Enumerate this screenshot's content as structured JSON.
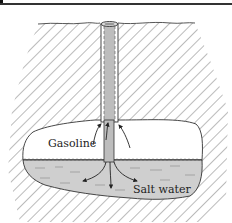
{
  "diagram": {
    "labels": {
      "gasoline": "Gasoline",
      "salt_water": "Salt water"
    },
    "colors": {
      "hatch": "#555555",
      "cavity_air": "#ffffff",
      "water": "#cfcfcf",
      "pipe_fill": "#bdbdbd",
      "pipe_stroke": "#333333",
      "outline": "#333333",
      "border": "#333333"
    }
  }
}
